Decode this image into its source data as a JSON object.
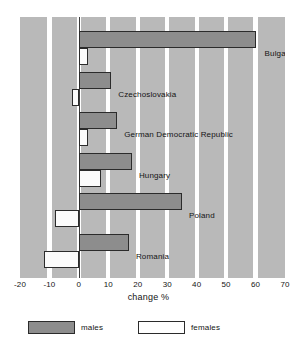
{
  "chart_data": {
    "type": "bar",
    "orientation": "horizontal",
    "title": "",
    "xlabel": "change %",
    "ylabel": "",
    "xlim": [
      -20,
      70
    ],
    "xticks": [
      -20,
      -10,
      0,
      10,
      20,
      30,
      40,
      50,
      60,
      70
    ],
    "xticklabels": [
      "-20",
      "-10",
      "0",
      "10",
      "20",
      "30",
      "40",
      "50",
      "60",
      "70"
    ],
    "grid": "vertical-bands",
    "legend_position": "below-axis",
    "categories": [
      "Bulgaria",
      "Czechoslovakia",
      "German Democratic Republic",
      "Hungary",
      "Poland",
      "Romania"
    ],
    "series": [
      {
        "name": "males",
        "color": "#8d8d8d",
        "values": [
          60,
          11,
          13,
          18,
          35,
          17
        ]
      },
      {
        "name": "females",
        "color": "#ffffff",
        "values": [
          3,
          -2.5,
          3,
          7.5,
          -8,
          -12
        ]
      }
    ]
  },
  "legend": {
    "items": [
      {
        "label": "males",
        "swatch": "males"
      },
      {
        "label": "females",
        "swatch": "females"
      }
    ]
  }
}
